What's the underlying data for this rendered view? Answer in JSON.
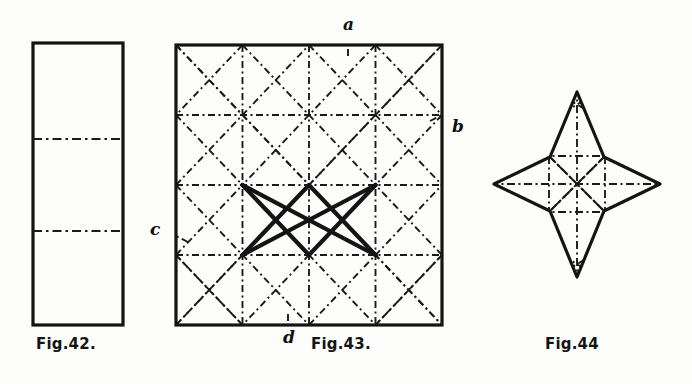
{
  "page": {
    "kind": "line-drawing-plate",
    "background_color": "#fdfdfb",
    "ink_color": "#141414",
    "width": 692,
    "height": 384
  },
  "figures": [
    {
      "id": "fig-42",
      "caption": "Fig.42.",
      "shape": "rectangle",
      "description": "Tall vertical rectangle divided into three equal bands by two horizontal dash-dot fold lines.",
      "solid_outline": true,
      "dashed_lines": 2,
      "geometry": {
        "x": 33,
        "y": 43,
        "width": 90,
        "height": 282
      },
      "fold_lines_y": [
        139,
        231
      ]
    },
    {
      "id": "fig-43",
      "caption": "Fig.43.",
      "shape": "square",
      "description": "Square divided by dash-dot lines into a 4x4 grid with full diagonals and diamond lattice; a bold solid X of two crossing chords occupies the centre.",
      "solid_outline": true,
      "geometry": {
        "x": 176,
        "y": 45,
        "width": 266,
        "height": 280
      },
      "grid_divisions": 4,
      "bold_chords": 2,
      "vertex_labels": [
        {
          "name": "a",
          "text": "a",
          "edge": "top",
          "position": "top-centre"
        },
        {
          "name": "b",
          "text": "b",
          "edge": "right",
          "position": "right-upper"
        },
        {
          "name": "c",
          "text": "c",
          "edge": "left",
          "position": "left-lower"
        },
        {
          "name": "d",
          "text": "d",
          "edge": "bottom",
          "position": "bottom-left-of-centre"
        }
      ]
    },
    {
      "id": "fig-44",
      "caption": "Fig.44",
      "shape": "four-pointed-star",
      "description": "Four-pointed star with concave sides, thick solid outline and an internal dash-dot radial and grid pattern.",
      "solid_outline": true,
      "points": 4,
      "geometry": {
        "cx": 577,
        "cy": 184,
        "outer_radius_h": 83,
        "outer_radius_v": 93,
        "inner_radius": 37
      }
    }
  ],
  "captions": {
    "fig42": "Fig.42.",
    "fig43": "Fig.43.",
    "fig44": "Fig.44"
  },
  "labels": {
    "a": "a",
    "b": "b",
    "c": "c",
    "d": "d"
  }
}
